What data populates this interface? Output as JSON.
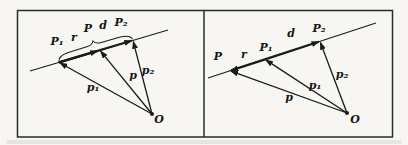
{
  "figure": {
    "colors": {
      "ink": "#1a1a1a",
      "paper": "#f7f6f2",
      "border": "#2b2b2b"
    },
    "left_panel": {
      "point_labels": {
        "p1": "P₁",
        "p": "P",
        "p2": "P₂"
      },
      "vector_labels": {
        "r": "r",
        "d": "d",
        "p1": "p₁",
        "p": "p",
        "p2": "p₂"
      },
      "origin_label": "O"
    },
    "right_panel": {
      "point_labels": {
        "p": "P",
        "p1": "P₁",
        "p2": "P₂"
      },
      "vector_labels": {
        "r": "r",
        "d": "d",
        "p1": "p₁",
        "p": "p",
        "p2": "p₂"
      },
      "origin_label": "O"
    }
  }
}
